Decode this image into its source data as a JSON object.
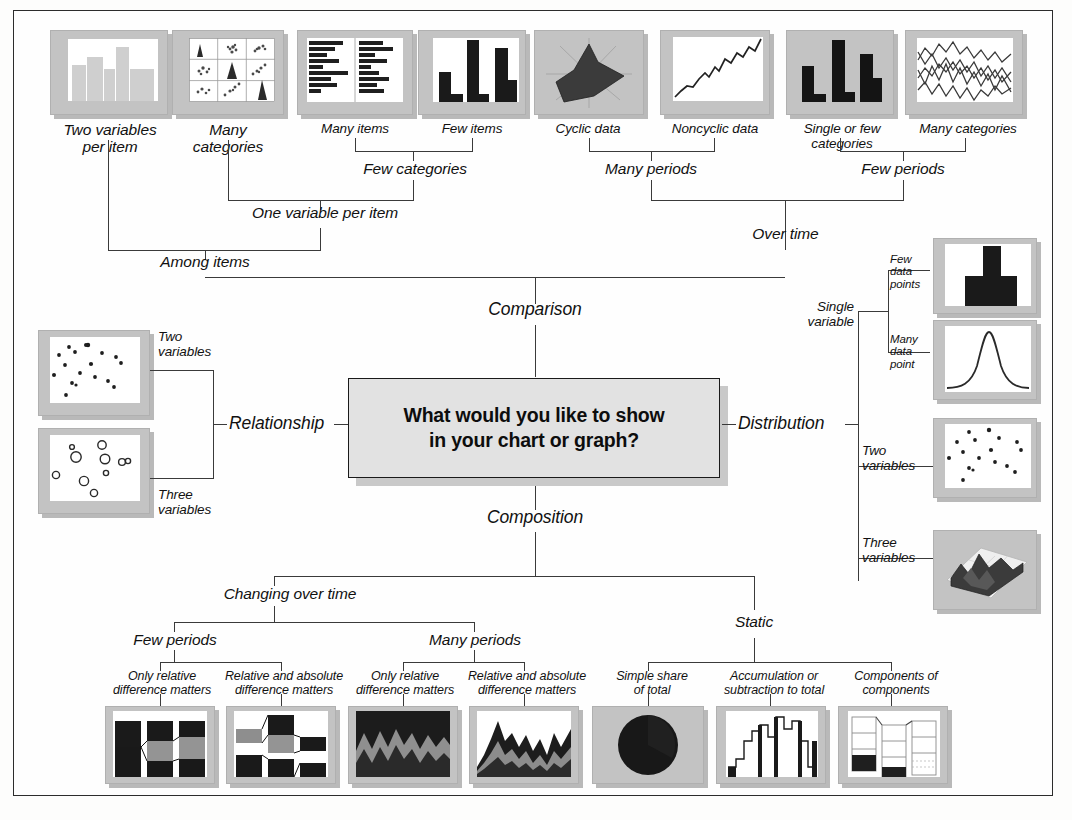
{
  "diagram": {
    "center_question": "What would you like to show\nin your chart or graph?",
    "branches": {
      "comparison": "Comparison",
      "relationship": "Relationship",
      "distribution": "Distribution",
      "composition": "Composition"
    }
  },
  "comparison": {
    "among_items": "Among items",
    "over_time": "Over time",
    "one_variable_per_item": "One variable per item",
    "few_categories": "Few categories",
    "many_periods": "Many periods",
    "few_periods": "Few periods",
    "leaves": [
      {
        "label": "Two variables\nper item",
        "chart": "variable-width-column-chart"
      },
      {
        "label": "Many\ncategories",
        "chart": "table-with-embedded-charts"
      },
      {
        "label": "Many items",
        "chart": "bar-chart"
      },
      {
        "label": "Few items",
        "chart": "column-chart"
      },
      {
        "label": "Cyclic data",
        "chart": "circular-area-chart"
      },
      {
        "label": "Noncyclic data",
        "chart": "line-chart"
      },
      {
        "label": "Single or few categories",
        "chart": "column-chart-time"
      },
      {
        "label": "Many categories",
        "chart": "line-chart-multi"
      }
    ]
  },
  "relationship": {
    "leaves": [
      {
        "label": "Two\nvariables",
        "chart": "scatter-chart"
      },
      {
        "label": "Three\nvariables",
        "chart": "bubble-chart"
      }
    ]
  },
  "distribution": {
    "single_variable": "Single\nvariable",
    "leaves": [
      {
        "label": "Few\ndata\npoints",
        "chart": "column-histogram"
      },
      {
        "label": "Many\ndata\npoint",
        "chart": "line-histogram"
      },
      {
        "label": "Two\nvariables",
        "chart": "scatter-chart"
      },
      {
        "label": "Three\nvariables",
        "chart": "3d-area-chart"
      }
    ]
  },
  "composition": {
    "changing_over_time": "Changing over time",
    "static": "Static",
    "few_periods": "Few periods",
    "many_periods": "Many periods",
    "leaves": [
      {
        "label": "Only relative\ndifference matters",
        "chart": "stacked-100-column-chart"
      },
      {
        "label": "Relative and absolute\ndifference matters",
        "chart": "stacked-column-chart"
      },
      {
        "label": "Only relative\ndifference matters",
        "chart": "stacked-100-area-chart"
      },
      {
        "label": "Relative and absolute\ndifference matters",
        "chart": "stacked-area-chart"
      },
      {
        "label": "Simple share\nof total",
        "chart": "pie-chart"
      },
      {
        "label": "Accumulation or\nsubtraction to total",
        "chart": "waterfall-chart"
      },
      {
        "label": "Components of\ncomponents",
        "chart": "stacked-100-column-with-subcomponents"
      }
    ]
  },
  "colors": {
    "frame": "#2c2c2c",
    "line": "#3a3a3a",
    "mat": "#c3c3c3",
    "shadow": "#b9b9b9",
    "box_fill": "#e2e2e2",
    "ink": "#111111"
  }
}
